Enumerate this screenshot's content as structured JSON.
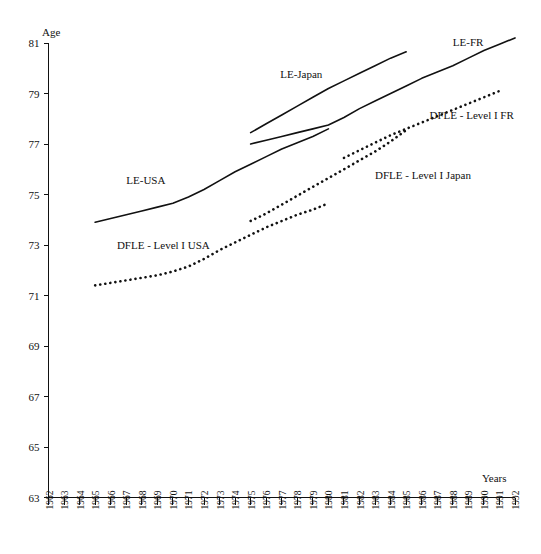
{
  "chart_data": {
    "type": "line",
    "title": "",
    "xlabel": "Years",
    "ylabel": "Age",
    "xlim": [
      1962,
      1992
    ],
    "ylim": [
      63,
      81
    ],
    "ytick_step": 2,
    "yticks": [
      63,
      65,
      67,
      69,
      71,
      73,
      75,
      77,
      79,
      81
    ],
    "xticks": [
      1962,
      1963,
      1964,
      1965,
      1966,
      1967,
      1968,
      1969,
      1970,
      1971,
      1972,
      1973,
      1974,
      1975,
      1976,
      1977,
      1978,
      1979,
      1980,
      1981,
      1982,
      1983,
      1984,
      1985,
      1986,
      1987,
      1988,
      1989,
      1990,
      1991,
      1992
    ],
    "grid": false,
    "legend": "inline-annotations",
    "series": [
      {
        "name": "LE-USA",
        "style": "solid",
        "color": "#111111",
        "x": [
          1965,
          1966,
          1967,
          1968,
          1969,
          1970,
          1971,
          1972,
          1973,
          1974,
          1975,
          1976,
          1977,
          1978,
          1979,
          1980
        ],
        "y": [
          73.9,
          74.05,
          74.2,
          74.35,
          74.5,
          74.65,
          74.9,
          75.2,
          75.55,
          75.9,
          76.2,
          76.5,
          76.8,
          77.05,
          77.3,
          77.6
        ],
        "label_pos": {
          "x": 1967.0,
          "y": 75.4
        }
      },
      {
        "name": "DFLE - Level I USA",
        "style": "dotted",
        "color": "#111111",
        "x": [
          1965,
          1966,
          1967,
          1968,
          1969,
          1970,
          1971,
          1972,
          1973,
          1974,
          1975,
          1976,
          1977,
          1978,
          1979,
          1980
        ],
        "y": [
          71.4,
          71.5,
          71.6,
          71.7,
          71.8,
          71.95,
          72.15,
          72.45,
          72.8,
          73.1,
          73.4,
          73.7,
          73.95,
          74.2,
          74.4,
          74.65
        ],
        "label_pos": {
          "x": 1966.4,
          "y": 72.85
        }
      },
      {
        "name": "LE-Japan",
        "style": "solid",
        "color": "#111111",
        "x": [
          1975,
          1976,
          1977,
          1978,
          1979,
          1980,
          1981,
          1982,
          1983,
          1984,
          1985
        ],
        "y": [
          77.45,
          77.8,
          78.15,
          78.5,
          78.85,
          79.2,
          79.5,
          79.8,
          80.1,
          80.4,
          80.65
        ],
        "label_pos": {
          "x": 1976.9,
          "y": 79.6
        }
      },
      {
        "name": "LE-FR",
        "style": "solid",
        "color": "#111111",
        "x": [
          1975,
          1976,
          1977,
          1978,
          1979,
          1980,
          1981,
          1982,
          1983,
          1984,
          1985,
          1986,
          1987,
          1988,
          1989,
          1990,
          1991,
          1992
        ],
        "y": [
          77.0,
          77.15,
          77.3,
          77.45,
          77.6,
          77.75,
          78.05,
          78.4,
          78.7,
          79.0,
          79.3,
          79.6,
          79.85,
          80.1,
          80.4,
          80.7,
          80.95,
          81.2
        ],
        "label_pos": {
          "x": 1988.0,
          "y": 80.9
        }
      },
      {
        "name": "DFLE - Level I Japan",
        "style": "dotted",
        "color": "#111111",
        "x": [
          1975,
          1976,
          1977,
          1978,
          1979,
          1980,
          1981,
          1982,
          1983,
          1984,
          1985
        ],
        "y": [
          73.95,
          74.25,
          74.6,
          74.95,
          75.3,
          75.65,
          76.0,
          76.35,
          76.7,
          77.1,
          77.55
        ],
        "label_pos": {
          "x": 1983.0,
          "y": 75.6
        }
      },
      {
        "name": "DFLE - Level I FR",
        "style": "dotted",
        "color": "#111111",
        "x": [
          1981,
          1982,
          1983,
          1984,
          1985,
          1986,
          1987,
          1988,
          1989,
          1990,
          1991
        ],
        "y": [
          76.45,
          76.75,
          77.05,
          77.35,
          77.6,
          77.85,
          78.1,
          78.35,
          78.6,
          78.85,
          79.1
        ],
        "label_pos": {
          "x": 1986.5,
          "y": 78.0
        }
      }
    ]
  },
  "labels": {
    "y_axis_title": "Age",
    "x_axis_title": "Years",
    "le_usa": "LE-USA",
    "dfle_usa": "DFLE - Level I USA",
    "le_japan": "LE-Japan",
    "le_fr": "LE-FR",
    "dfle_japan": "DFLE - Level I Japan",
    "dfle_fr": "DFLE - Level I FR"
  }
}
